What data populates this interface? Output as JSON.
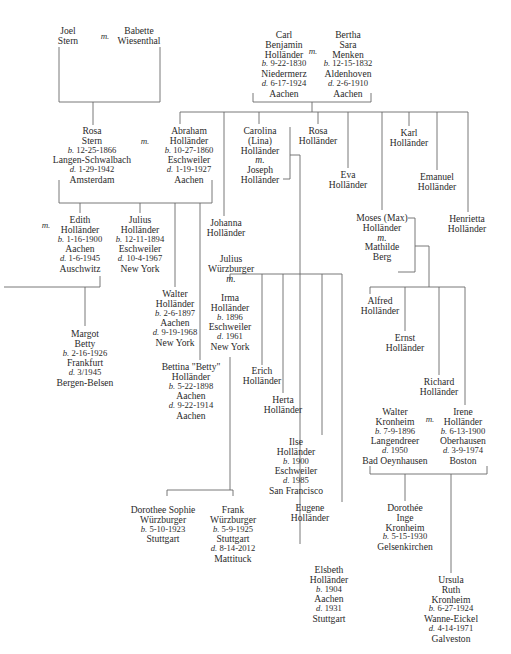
{
  "diagram": {
    "type": "family-tree",
    "marriage_marker": "m.",
    "people": [
      {
        "id": "joel",
        "x": 68,
        "y": 26,
        "lines": [
          "Joel",
          "Stern"
        ]
      },
      {
        "id": "babette",
        "x": 139,
        "y": 26,
        "lines": [
          "Babette",
          "Wiesenthal"
        ]
      },
      {
        "id": "carl",
        "x": 284,
        "y": 30,
        "lines": [
          "Carl",
          "Benjamin",
          "Holländer",
          "b. 9-22-1830",
          "Niedermerz",
          "d. 6-17-1924",
          "Aachen"
        ]
      },
      {
        "id": "bertha",
        "x": 348,
        "y": 30,
        "lines": [
          "Bertha",
          "Sara",
          "Menken",
          "b. 12-15-1832",
          "Aldenhoven",
          "d. 2-6-1910",
          "Aachen"
        ]
      },
      {
        "id": "rosa_stern",
        "x": 92,
        "y": 126,
        "lines": [
          "Rosa",
          "Stern",
          "b. 12-25-1866",
          "Langen-Schwalbach",
          "d. 1-29-1942",
          "Amsterdam"
        ]
      },
      {
        "id": "abraham",
        "x": 189,
        "y": 126,
        "lines": [
          "Abraham",
          "Holländer",
          "b. 10-27-1860",
          "Eschweiler",
          "d. 1-19-1927",
          "Aachen"
        ]
      },
      {
        "id": "carolina",
        "x": 260,
        "y": 126,
        "lines": [
          "Carolina",
          "(Lina)",
          "Holländer",
          "m.",
          "Joseph",
          "Holländer"
        ]
      },
      {
        "id": "rosa_h",
        "x": 318,
        "y": 126,
        "lines": [
          "Rosa",
          "Holländer"
        ]
      },
      {
        "id": "karl",
        "x": 409,
        "y": 128,
        "lines": [
          "Karl",
          "Holländer"
        ]
      },
      {
        "id": "eva",
        "x": 348,
        "y": 170,
        "lines": [
          "Eva",
          "Holländer"
        ]
      },
      {
        "id": "emanuel",
        "x": 437,
        "y": 172,
        "lines": [
          "Emanuel",
          "Holländer"
        ]
      },
      {
        "id": "henrietta",
        "x": 467,
        "y": 214,
        "lines": [
          "Henrietta",
          "Holländer"
        ]
      },
      {
        "id": "moses",
        "x": 382,
        "y": 213,
        "lines": [
          "Moses (Max)",
          "Holländer",
          "m.",
          "Mathilde",
          "Berg"
        ]
      },
      {
        "id": "edith",
        "x": 80,
        "y": 215,
        "lines": [
          "Edith",
          "Holländer",
          "b. 1-16-1900",
          "Aachen",
          "d. 1-6-1945",
          "Auschwitz"
        ]
      },
      {
        "id": "julius_h",
        "x": 140,
        "y": 215,
        "lines": [
          "Julius",
          "Holländer",
          "b. 12-11-1894",
          "Eschweiler",
          "d. 10-4-1967",
          "New York"
        ]
      },
      {
        "id": "johanna",
        "x": 226,
        "y": 218,
        "lines": [
          "Johanna",
          "Holländer"
        ]
      },
      {
        "id": "julius_w",
        "x": 231,
        "y": 254,
        "lines": [
          "Julius",
          "Würzburger",
          "m."
        ]
      },
      {
        "id": "walter_h",
        "x": 175,
        "y": 289,
        "lines": [
          "Walter",
          "Holländer",
          "b. 2-6-1897",
          "Aachen",
          "d. 9-19-1968",
          "New York"
        ]
      },
      {
        "id": "irma",
        "x": 230,
        "y": 293,
        "lines": [
          "Irma",
          "Holländer",
          "b. 1896",
          "Eschweiler",
          "d. 1961",
          "New York"
        ]
      },
      {
        "id": "margot",
        "x": 85,
        "y": 329,
        "lines": [
          "Margot",
          "Betty",
          "b. 2-16-1926",
          "Frankfurt",
          "d. 3/1945",
          "Bergen-Belsen"
        ]
      },
      {
        "id": "bettina",
        "x": 191,
        "y": 362,
        "lines": [
          "Bettina \"Betty\"",
          "Holländer",
          "b. 5-22-1898",
          "Aachen",
          "d. 9-22-1914",
          "Aachen"
        ]
      },
      {
        "id": "alfred",
        "x": 380,
        "y": 296,
        "lines": [
          "Alfred",
          "Holländer"
        ]
      },
      {
        "id": "ernst",
        "x": 405,
        "y": 333,
        "lines": [
          "Ernst",
          "Holländer"
        ]
      },
      {
        "id": "erich",
        "x": 262,
        "y": 366,
        "lines": [
          "Erich",
          "Holländer"
        ]
      },
      {
        "id": "richard",
        "x": 439,
        "y": 377,
        "lines": [
          "Richard",
          "Holländer"
        ]
      },
      {
        "id": "herta",
        "x": 283,
        "y": 395,
        "lines": [
          "Herta",
          "Holländer"
        ]
      },
      {
        "id": "walter_k",
        "x": 395,
        "y": 407,
        "lines": [
          "Walter",
          "Kronheim",
          "b. 7-9-1896",
          "Langendreer",
          "d. 1950",
          "Bad Oeynhausen"
        ]
      },
      {
        "id": "irene",
        "x": 463,
        "y": 407,
        "lines": [
          "Irene",
          "Holländer",
          "b. 6-13-1900",
          "Oberhausen",
          "d. 3-9-1974",
          "Boston"
        ]
      },
      {
        "id": "ilse",
        "x": 296,
        "y": 437,
        "lines": [
          "Ilse",
          "Holländer",
          "b. 1900",
          "Eschweiler",
          "d. 1985",
          "San Francisco"
        ]
      },
      {
        "id": "eugene",
        "x": 310,
        "y": 503,
        "lines": [
          "Eugene",
          "Holländer"
        ]
      },
      {
        "id": "dorothee_k",
        "x": 405,
        "y": 503,
        "lines": [
          "Dorothée",
          "Inge",
          "Kronheim",
          "b. 5-15-1930",
          "Gelsenkirchen"
        ]
      },
      {
        "id": "dorothee_w",
        "x": 163,
        "y": 505,
        "lines": [
          "Dorothee Sophie",
          "Würzburger",
          "b. 5-10-1923",
          "Stuttgart"
        ]
      },
      {
        "id": "frank",
        "x": 233,
        "y": 505,
        "lines": [
          "Frank",
          "Würzburger",
          "b. 5-9-1925",
          "Stuttgart",
          "d. 8-14-2012",
          "Mattituck"
        ]
      },
      {
        "id": "elsbeth",
        "x": 329,
        "y": 565,
        "lines": [
          "Elsbeth",
          "Holländer",
          "b. 1904",
          "Aachen",
          "d. 1931",
          "Stuttgart"
        ]
      },
      {
        "id": "ursula",
        "x": 451,
        "y": 575,
        "lines": [
          "Ursula",
          "Ruth",
          "Kronheim",
          "b. 6-27-1924",
          "Wanne-Eickel",
          "d. 4-14-1971",
          "Galveston"
        ]
      }
    ],
    "marriage_labels": [
      {
        "id": "m_joel_babette",
        "x": 105,
        "y": 31
      },
      {
        "id": "m_carl_bertha",
        "x": 313,
        "y": 46
      },
      {
        "id": "m_rosa_abraham",
        "x": 145,
        "y": 136
      },
      {
        "id": "m_edith_left",
        "x": 46,
        "y": 220
      },
      {
        "id": "m_walter_irene",
        "x": 430,
        "y": 414
      }
    ]
  }
}
